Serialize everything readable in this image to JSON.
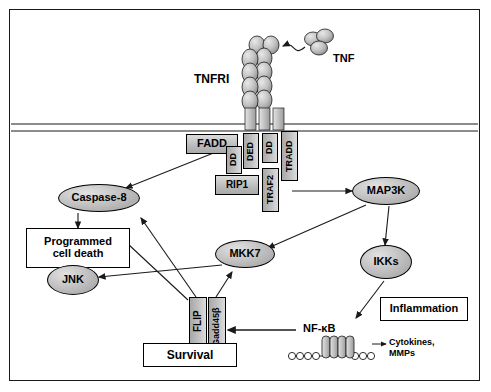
{
  "figure": {
    "membrane_label": "plasma-membrane"
  },
  "nodes": {
    "tnf": "TNF",
    "tnfri": "TNFRI",
    "fadd": "FADD",
    "dd_receptor": "DD",
    "dd_tradd": "DD",
    "dd_fadd": "DD",
    "ded": "DED",
    "tradd": "TRADD",
    "rip1": "RIP1",
    "traf2": "TRAF2",
    "caspase8": "Caspase-8",
    "map3k": "MAP3K",
    "mkk7": "MKK7",
    "ikks": "IKKs",
    "jnk": "JNK",
    "flip": "FLIP",
    "gadd45b": "Gadd45β",
    "nfkb": "NF-κB",
    "programmed_cell_death": "Programmed\ncell death",
    "programmed_cell_death_line1": "Programmed",
    "programmed_cell_death_line2": "cell death",
    "survival": "Survival",
    "inflammation": "Inflammation",
    "cytokines_line1": "Cytokines,",
    "cytokines_line2": "MMPs"
  },
  "colors": {
    "outline": "#1a1a1a",
    "node_fill_light": "#dcdcdc",
    "node_fill_mid": "#bdbdbd",
    "node_fill_dark": "#9e9e9e",
    "background": "#ffffff",
    "text": "#000000"
  }
}
